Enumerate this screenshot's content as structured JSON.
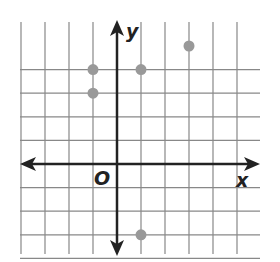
{
  "diagram": {
    "type": "coordinate-grid",
    "axes": {
      "x_label": "x",
      "y_label": "y",
      "origin_label": "O",
      "x_range": [
        -4,
        5
      ],
      "y_range": [
        -4,
        5
      ]
    },
    "grid": {
      "x_min": -4,
      "x_max": 6,
      "y_min": -4,
      "y_max": 5,
      "line_color": "#888888",
      "axis_color": "#222222"
    },
    "points": [
      {
        "x": -1,
        "y": 4
      },
      {
        "x": 1,
        "y": 4
      },
      {
        "x": -1,
        "y": 3
      },
      {
        "x": 3,
        "y": 5
      },
      {
        "x": 1,
        "y": -3
      }
    ],
    "point_color": "#999999"
  }
}
